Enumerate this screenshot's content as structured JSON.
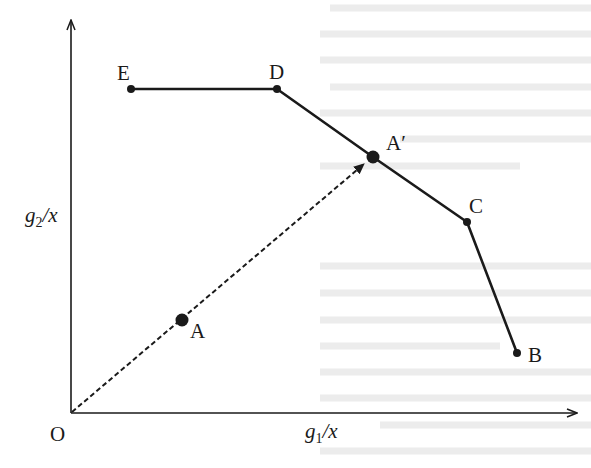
{
  "diagram": {
    "type": "efficiency-frontier",
    "axes": {
      "x_label_main": "g",
      "x_label_sub": "1",
      "x_label_tail": "/x",
      "y_label_main": "g",
      "y_label_sub": "2",
      "y_label_tail": "/x",
      "origin_label": "O"
    },
    "frontier_points": [
      {
        "id": "E",
        "label": "E",
        "x": 131,
        "y": 89
      },
      {
        "id": "D",
        "label": "D",
        "x": 277,
        "y": 89
      },
      {
        "id": "A_prime",
        "label": "A′",
        "x": 373,
        "y": 157
      },
      {
        "id": "C",
        "label": "C",
        "x": 467,
        "y": 222
      },
      {
        "id": "B",
        "label": "B",
        "x": 517,
        "y": 353
      }
    ],
    "inefficient_point": {
      "id": "A",
      "label": "A",
      "x": 182,
      "y": 320
    },
    "projection": {
      "from": "O",
      "through": "A",
      "to": "A′",
      "style": "dashed-arrow"
    },
    "colors": {
      "ink": "#1a1a1a",
      "background": "#ffffff",
      "bleed": "#ececec"
    }
  }
}
